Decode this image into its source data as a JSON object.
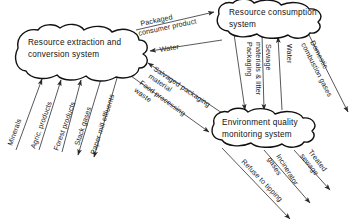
{
  "diagram": {
    "colors": {
      "background": "#ffffff",
      "node_stroke": "#111111",
      "node_fill": "#ffffff",
      "edge_stroke": "#3a3a3a",
      "text": "#111111"
    },
    "nodes": [
      {
        "id": "resource-extraction",
        "lines": [
          "Resource extraction and",
          "conversion system"
        ]
      },
      {
        "id": "resource-consumption",
        "lines": [
          "Resource consumption",
          "system"
        ]
      },
      {
        "id": "environment-quality",
        "lines": [
          "Environment quality",
          "monitoring system"
        ]
      }
    ],
    "edge_labels": {
      "packaged_consumer_product": [
        "Packaged",
        "consumer product"
      ],
      "water_to_extraction": [
        "Water"
      ],
      "salvaged_packaging_material": [
        "Salvaged packaging",
        "material"
      ],
      "food_processing_waste": [
        "Food processing",
        "waste"
      ],
      "minerals": [
        "Minerals"
      ],
      "agric_products": [
        "Agric. products"
      ],
      "forest_products": [
        "Forest products"
      ],
      "stack_gases": [
        "Stack gases"
      ],
      "paper_mill_effluents": [
        "Paper mill effluents"
      ],
      "packaging_materials_litter": [
        "Packaging",
        "materials & litter"
      ],
      "sewage": [
        "Sewage"
      ],
      "water_to_consumption": [
        "Water"
      ],
      "domestic_combustion_gases": [
        "Domestic",
        "combustion gases"
      ],
      "treated_sewage": [
        "Treated",
        "sewage"
      ],
      "incinerator_gases": [
        "Incinerator",
        "gases"
      ],
      "refuse_to_tipping": [
        "Refuse to tipping"
      ]
    }
  }
}
